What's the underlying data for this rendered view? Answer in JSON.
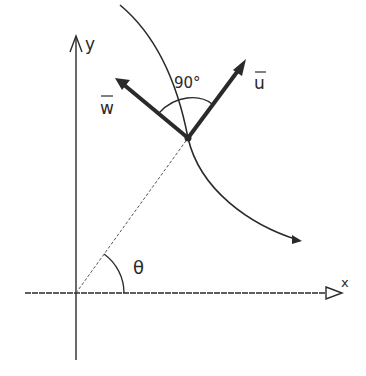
{
  "diagram": {
    "axes": {
      "y_label": "y",
      "x_label": "x",
      "origin": [
        76,
        293
      ]
    },
    "vectors": [
      {
        "name": "u",
        "label": "u",
        "overbar": true,
        "from": [
          188,
          138
        ],
        "to": [
          246,
          61
        ]
      },
      {
        "name": "w",
        "label": "w",
        "overbar": true,
        "from": [
          188,
          138
        ],
        "to": [
          115,
          78
        ]
      }
    ],
    "angles": {
      "right_angle_label": "90°",
      "theta_label": "θ"
    },
    "curve": {
      "description": "trajectory curve passing through the point, arrow at end"
    },
    "colors": {
      "ink": "#2a2a2a",
      "background": "#ffffff"
    }
  }
}
